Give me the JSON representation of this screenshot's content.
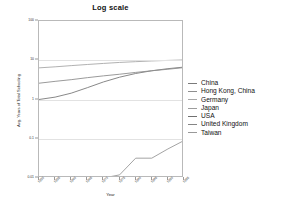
{
  "chart_data": {
    "type": "line",
    "title": "Log scale",
    "xlabel": "Year",
    "ylabel": "Avg. Years of Total Schooling",
    "log_y": true,
    "grid": true,
    "legend_position": "right",
    "ylim": [
      0.01,
      100
    ],
    "yticks": [
      "100",
      "10",
      "1",
      "0.1",
      "0.01"
    ],
    "ytick_values": [
      100,
      10,
      1,
      0.1,
      0.01
    ],
    "x": [
      1950,
      1955,
      1960,
      1965,
      1970,
      1975,
      1980,
      1985,
      1990,
      1995
    ],
    "xticks": [
      "1950",
      "1955",
      "1960",
      "1965",
      "1970",
      "1975",
      "1980",
      "1985",
      "1990",
      "1995"
    ],
    "series": [
      {
        "name": "China",
        "color": "#7a7a7a",
        "values": [
          1.0,
          1.15,
          1.45,
          2.0,
          2.8,
          3.7,
          4.6,
          5.4,
          6.1,
          6.7
        ]
      },
      {
        "name": "Hong Kong, China",
        "color": "#8f8f8f",
        "values": [
          2.6,
          2.9,
          3.2,
          3.6,
          4.0,
          4.4,
          4.9,
          5.4,
          5.9,
          6.5
        ]
      },
      {
        "name": "Germany",
        "color": "#a8a8a8",
        "values": [
          6.4,
          6.8,
          7.3,
          7.8,
          8.3,
          8.8,
          9.2,
          9.6,
          9.9,
          10.2
        ]
      },
      {
        "name": "Japan",
        "color": "#9c9c9c",
        "values": [
          null,
          null,
          null,
          null,
          null,
          null,
          null,
          null,
          null,
          null
        ]
      },
      {
        "name": "USA",
        "color": "#707070",
        "values": [
          null,
          null,
          null,
          null,
          null,
          null,
          null,
          null,
          null,
          null
        ]
      },
      {
        "name": "United Kingdom",
        "color": "#858585",
        "values": [
          null,
          null,
          null,
          null,
          null,
          null,
          null,
          null,
          null,
          null
        ]
      },
      {
        "name": "Taiwan",
        "color": "#999999",
        "values": [
          0.01,
          0.01,
          0.01,
          0.01,
          0.01,
          0.012,
          0.032,
          0.032,
          0.055,
          0.09
        ]
      }
    ]
  },
  "legend": {
    "items": [
      {
        "label": "China"
      },
      {
        "label": "Hong Kong, China"
      },
      {
        "label": "Germany"
      },
      {
        "label": "Japan"
      },
      {
        "label": "USA"
      },
      {
        "label": "United Kingdom"
      },
      {
        "label": "Taiwan"
      }
    ]
  }
}
